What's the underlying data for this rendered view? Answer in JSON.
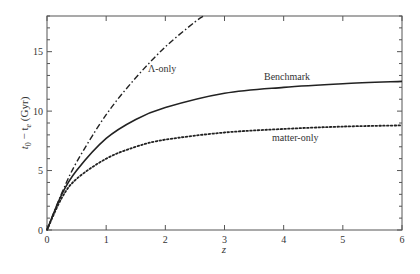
{
  "chart_data": {
    "type": "line",
    "title": "",
    "xlabel": "z",
    "ylabel": "t0 − te (Gyr)",
    "xlim": [
      0,
      6
    ],
    "ylim": [
      0,
      18
    ],
    "x_ticks": [
      0,
      1,
      2,
      3,
      4,
      5,
      6
    ],
    "y_ticks": [
      0,
      5,
      10,
      15
    ],
    "grid": false,
    "legend": "inline labels",
    "series": [
      {
        "name": "Benchmark",
        "style": "solid",
        "x": [
          0,
          0.25,
          0.5,
          1,
          1.5,
          2,
          3,
          4,
          5,
          6
        ],
        "values": [
          0,
          3.0,
          5.0,
          7.7,
          9.3,
          10.3,
          11.5,
          12.0,
          12.3,
          12.5
        ]
      },
      {
        "name": "Λ-only",
        "style": "dash-dot",
        "x": [
          0,
          0.25,
          0.5,
          1,
          1.5,
          2,
          2.5,
          2.65
        ],
        "values": [
          0,
          3.1,
          5.7,
          9.7,
          12.8,
          15.4,
          17.5,
          18.0
        ]
      },
      {
        "name": "matter-only",
        "style": "dotted",
        "x": [
          0,
          0.25,
          0.5,
          1,
          1.5,
          2,
          3,
          4,
          5,
          6
        ],
        "values": [
          0,
          2.7,
          4.3,
          6.0,
          7.0,
          7.6,
          8.2,
          8.5,
          8.7,
          8.8
        ]
      }
    ]
  },
  "labels": {
    "x_axis": "z",
    "y_axis_main": "t",
    "y_axis_sub0": "0",
    "y_axis_mid": " − t",
    "y_axis_sube": "e",
    "y_axis_unit": " (Gyr)",
    "benchmark": "Benchmark",
    "lambda_only": "Λ-only",
    "matter_only": "matter-only"
  }
}
